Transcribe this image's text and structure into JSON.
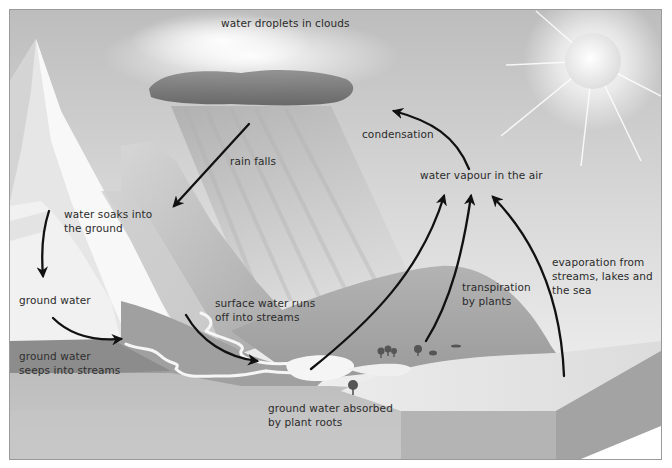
{
  "diagram": {
    "type": "water-cycle",
    "colors": {
      "sky_top": "#b9b9b9",
      "sky_light": "#ececec",
      "cloud_dark": "#6e6e6e",
      "mountain": "#f4f4f4",
      "hill": "#a9a9a9",
      "ground": "#bdbdbd",
      "water": "#f7f7f7",
      "sea": "#e4e4e4",
      "arrow": "#111111",
      "text": "#2b2b2b"
    },
    "labels": {
      "clouds": "water droplets in clouds",
      "rain": "rain falls",
      "condensation": "condensation",
      "vapour": "water vapour in the air",
      "soaks_line1": "water soaks into",
      "soaks_line2": "the ground",
      "ground_water": "ground water",
      "seeps_line1": "ground water",
      "seeps_line2": "seeps into streams",
      "runoff_line1": "surface water runs",
      "runoff_line2": "off into streams",
      "transpiration_line1": "transpiration",
      "transpiration_line2": "by plants",
      "evaporation_line1": "evaporation from",
      "evaporation_line2": "streams, lakes and",
      "evaporation_line3": "the sea",
      "roots_line1": "ground water absorbed",
      "roots_line2": "by plant roots"
    },
    "elements": [
      "sun",
      "cloud",
      "rain",
      "mountain",
      "hills",
      "stream",
      "lake",
      "sea",
      "trees",
      "ground-cross-section"
    ],
    "arrows": [
      {
        "name": "rain-arrow",
        "from": "cloud",
        "to": "mountain"
      },
      {
        "name": "condensation-arrow",
        "from": "water vapour",
        "to": "cloud"
      },
      {
        "name": "soak-arrow",
        "from": "surface",
        "to": "ground water"
      },
      {
        "name": "groundwater-seep-arrow",
        "from": "ground water",
        "to": "stream"
      },
      {
        "name": "runoff-arrow",
        "from": "mountain slope",
        "to": "stream"
      },
      {
        "name": "lake-evaporation-arrow",
        "from": "lake",
        "to": "water vapour"
      },
      {
        "name": "transpiration-arrow",
        "from": "plants",
        "to": "water vapour"
      },
      {
        "name": "sea-evaporation-arrow",
        "from": "sea",
        "to": "water vapour"
      }
    ]
  }
}
